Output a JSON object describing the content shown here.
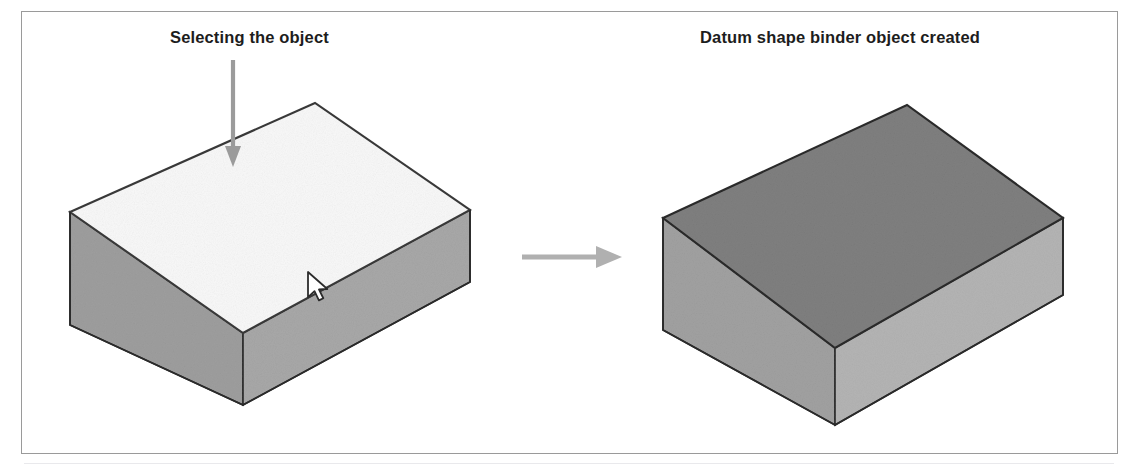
{
  "figure": {
    "type": "instructional-diagram",
    "background_color": "#ffffff",
    "frame_border_color": "#9a9a9a",
    "panels": [
      {
        "id": "before",
        "label": "Selecting the object",
        "annotation_arrow": "down-arrow-icon",
        "cursor": "mouse-pointer-icon",
        "solid_top_face_state": "unselected"
      },
      {
        "id": "after",
        "label": "Datum shape binder object created",
        "solid_top_face_state": "selected-shaded"
      }
    ],
    "transition_arrow": "right-arrow-icon",
    "caption": ""
  },
  "labels": {
    "left": "Selecting the object",
    "right": "Datum shape binder object created"
  },
  "colors": {
    "text": "#1d1d1d",
    "frame": "#9a9a9a",
    "annotation_arrow": "#9b9b9b",
    "transition_arrow": "#b0b0b0",
    "outline": "#2a2a2a",
    "left_top_face": "#f7f7f7",
    "left_left_face": "#9e9e9e",
    "left_right_face": "#a8a8a8",
    "right_top_face": "#7f7f7f",
    "right_left_face": "#a1a1a1",
    "right_right_face": "#b4b4b4",
    "cursor_fill": "#ffffff",
    "cursor_stroke": "#2b2b2b"
  },
  "geometry": {
    "left_solid": {
      "top_face": "70,212 315,103 470,210 243,333",
      "left_face": "70,212 243,333 243,405 70,325",
      "right_face": "243,333 470,210 470,282 243,405"
    },
    "right_solid": {
      "top_face": "663,218 907,105 1063,218 835,348",
      "left_face": "663,218 835,348 835,425 663,330",
      "right_face": "835,348 1063,218 1063,295 835,425"
    },
    "annotation_arrow": {
      "x": 233,
      "y1": 62,
      "y2": 162
    },
    "transition_arrow": {
      "x1": 522,
      "y1": 257,
      "x2": 618,
      "y2": 257
    },
    "cursor": {
      "x": 310,
      "y": 278
    }
  }
}
